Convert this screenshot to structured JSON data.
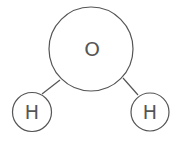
{
  "diagram": {
    "title": "",
    "molecule": "H2O",
    "colors": {
      "stroke": "#555555",
      "background": "#ffffff"
    },
    "atoms": [
      {
        "id": "oxygen",
        "label": "O",
        "cx": 91,
        "cy": 49,
        "r": 42
      },
      {
        "id": "hydrogen-left",
        "label": "H",
        "cx": 32,
        "cy": 112,
        "r": 19.5
      },
      {
        "id": "hydrogen-right",
        "label": "H",
        "cx": 150,
        "cy": 112,
        "r": 19
      }
    ],
    "bonds": [
      {
        "from": "oxygen",
        "to": "hydrogen-left"
      },
      {
        "from": "oxygen",
        "to": "hydrogen-right"
      }
    ]
  }
}
